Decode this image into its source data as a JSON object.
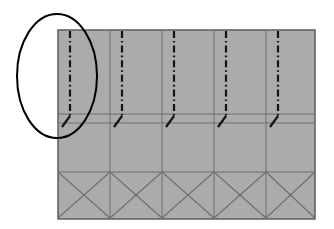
{
  "figure": {
    "title": "Panel assembly elevation with highlighted fold line detail",
    "background_color": "#ffffff"
  },
  "canvas": {
    "width": 334,
    "height": 229
  },
  "panel": {
    "name": "main-panel",
    "x": 58,
    "y": 30,
    "width": 257,
    "height": 189,
    "fill_color": "#ababab",
    "stroke_color": "#555555",
    "stroke_width": 1.4
  },
  "bays": {
    "count": 5,
    "divider_x": [
      58,
      110,
      162,
      214,
      266,
      315
    ],
    "interior_divider_x": [
      110,
      162,
      214,
      266
    ],
    "divider_color": "#6e6e6e",
    "divider_width": 1
  },
  "bands": {
    "horizontal_rule_y": [
      114,
      123,
      172
    ],
    "rule_color": "#6e6e6e",
    "rule_width": 1,
    "labels": [
      "upper-band",
      "mid-band",
      "lower-brace-band"
    ]
  },
  "center_lines": {
    "style": "dash-dot",
    "color": "#141414",
    "width": 2.2,
    "dash_pattern": "7 3 1.6 3",
    "y_start": 31,
    "y_end": 116,
    "x_positions": [
      70,
      122,
      174,
      226,
      278
    ]
  },
  "tick_marks": {
    "style": "short-diagonal-stroke",
    "color": "#141414",
    "width": 2.2,
    "dx": -8,
    "dy": 11,
    "origin_y": 116,
    "x_positions": [
      70,
      122,
      174,
      226,
      278
    ]
  },
  "cross_braces": {
    "band_top_y": 172,
    "band_bottom_y": 218,
    "color": "#6e6e6e",
    "width": 1.1,
    "cells": [
      {
        "x0": 58,
        "x1": 110
      },
      {
        "x0": 110,
        "x1": 162
      },
      {
        "x0": 162,
        "x1": 214
      },
      {
        "x0": 214,
        "x1": 266
      },
      {
        "x0": 266,
        "x1": 315
      }
    ]
  },
  "annotation_ellipse": {
    "name": "highlight-ellipse",
    "cx": 57,
    "cy": 76,
    "rx": 40,
    "ry": 62,
    "stroke_color": "#000000",
    "stroke_width": 2,
    "fill": "none"
  }
}
